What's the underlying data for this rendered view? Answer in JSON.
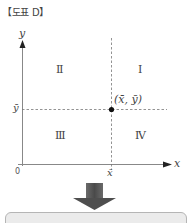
{
  "title": "【도표 D】",
  "axes": {
    "x_label": "x",
    "y_label": "y",
    "origin_label": "0",
    "x_mean_label": "x̄",
    "y_mean_label": "ȳ"
  },
  "point": {
    "label": "(x̄, ȳ)"
  },
  "quadrants": {
    "q1": "Ⅰ",
    "q2": "Ⅱ",
    "q3": "Ⅲ",
    "q4": "Ⅳ"
  },
  "colors": {
    "axis": "#888888",
    "dashed": "#777777",
    "point": "#111111",
    "arrow": "#555555",
    "box_fill": "#ebebeb",
    "box_border": "#b5b5b5"
  }
}
